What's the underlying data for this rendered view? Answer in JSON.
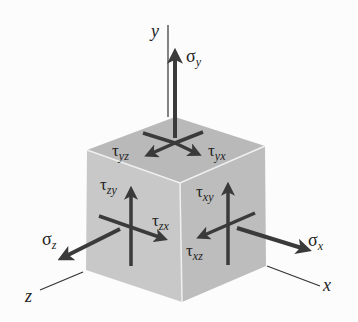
{
  "diagram": {
    "axes": {
      "x": "x",
      "y": "y",
      "z": "z"
    },
    "normal_stresses": {
      "sigma_x": {
        "symbol": "σ",
        "sub": "x"
      },
      "sigma_y": {
        "symbol": "σ",
        "sub": "y"
      },
      "sigma_z": {
        "symbol": "σ",
        "sub": "z"
      }
    },
    "shear_stresses": {
      "tau_yz": {
        "symbol": "τ",
        "sub": "yz"
      },
      "tau_yx": {
        "symbol": "τ",
        "sub": "yx"
      },
      "tau_zy": {
        "symbol": "τ",
        "sub": "zy"
      },
      "tau_zx": {
        "symbol": "τ",
        "sub": "zx"
      },
      "tau_xy": {
        "symbol": "τ",
        "sub": "xy"
      },
      "tau_xz": {
        "symbol": "τ",
        "sub": "xz"
      }
    },
    "colors": {
      "cube_top": "#b9b9b9",
      "cube_left": "#c6c6c6",
      "cube_right": "#bdbdbd",
      "edge_highlight": "#efefef",
      "arrow": "#3a3a3a",
      "axis_line": "#333333"
    }
  }
}
